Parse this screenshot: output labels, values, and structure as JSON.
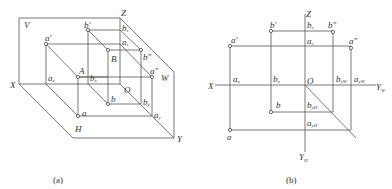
{
  "figure": {
    "panels": [
      {
        "id": "a",
        "caption": "(a)",
        "description": "Three-plane projection system (isometric view) with points A and B projected onto V, H, W planes",
        "plane_labels": {
          "V": "V",
          "H": "H",
          "W": "W"
        },
        "axis_labels": {
          "X": "X",
          "Y": "Y",
          "Z": "Z",
          "O": "O"
        },
        "points": {
          "A": "A",
          "B": "B",
          "a_prime": "a",
          "a_prime_mark": "′",
          "b_prime": "b",
          "b_prime_mark": "′",
          "a_dprime": "a",
          "a_dprime_mark": "″",
          "b_dprime": "b",
          "b_dprime_mark": "″",
          "a": "a",
          "b": "b"
        },
        "axis_points": {
          "a_x": "a",
          "a_x_sub": "x",
          "b_x": "b",
          "b_x_sub": "x",
          "a_z": "a",
          "a_z_sub": "z",
          "b_z": "b",
          "b_z_sub": "z",
          "a_y": "a",
          "a_y_sub": "y",
          "b_y": "b",
          "b_y_sub": "y"
        }
      },
      {
        "id": "b",
        "caption": "(b)",
        "description": "Unfolded three-view projection drawing of points A and B",
        "axis_labels": {
          "X": "X",
          "Z": "Z",
          "O": "O",
          "Y_W": "Y",
          "Y_W_sub": "W",
          "Y_H": "Y",
          "Y_H_sub": "H"
        },
        "points": {
          "a_prime": "a",
          "a_prime_mark": "′",
          "b_prime": "b",
          "b_prime_mark": "′",
          "a_dprime": "a",
          "a_dprime_mark": "″",
          "b_dprime": "b",
          "b_dprime_mark": "″",
          "a": "a",
          "b": "b"
        },
        "axis_points": {
          "a_x": "a",
          "a_x_sub": "x",
          "b_x": "b",
          "b_x_sub": "x",
          "a_z": "a",
          "a_z_sub": "z",
          "b_z": "b",
          "b_z_sub": "z",
          "a_yW": "a",
          "a_yW_sub": "yW",
          "b_yW": "b",
          "b_yW_sub": "yW",
          "a_yH": "a",
          "a_yH_sub": "yH",
          "b_yH": "b",
          "b_yH_sub": "yH"
        }
      }
    ]
  }
}
